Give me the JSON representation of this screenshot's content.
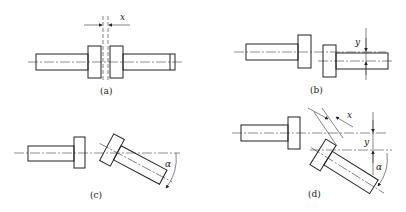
{
  "diagram": {
    "panels": [
      {
        "id": "a",
        "caption": "(a)",
        "symbol": "x",
        "description": "axial gap"
      },
      {
        "id": "b",
        "caption": "(b)",
        "symbol": "y",
        "description": "radial (parallel) offset"
      },
      {
        "id": "c",
        "caption": "(c)",
        "symbol": "α",
        "description": "angular misalignment"
      },
      {
        "id": "d",
        "caption": "(d)",
        "symbols": [
          "x",
          "y",
          "α"
        ],
        "description": "combined misalignment"
      }
    ]
  }
}
